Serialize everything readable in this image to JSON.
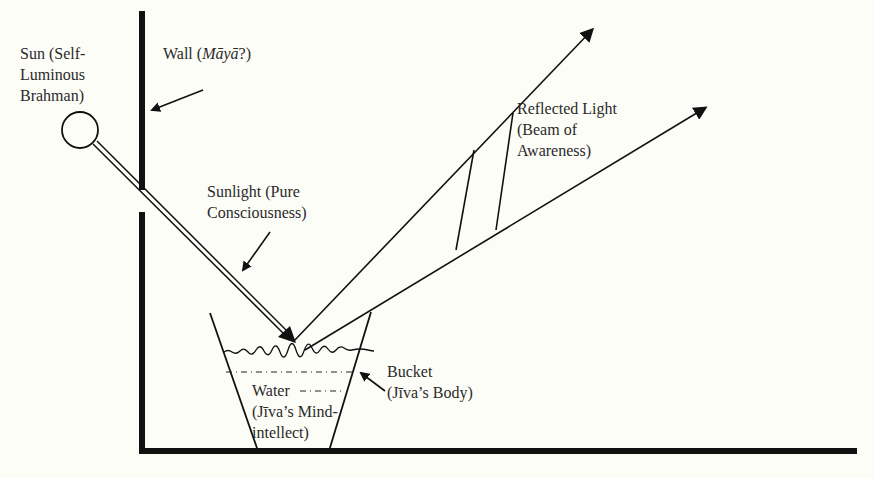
{
  "diagram": {
    "colors": {
      "background": "#fdfdf8",
      "ink": "#111111",
      "text": "#2a2a2a"
    },
    "labels": {
      "sun": {
        "line1": "Sun (Self-",
        "line2": "Luminous",
        "line3": "Brahman)"
      },
      "wall": {
        "prefix": "Wall (",
        "italic": "Māyā",
        "suffix": "?)"
      },
      "sunlight": {
        "line1": "Sunlight (Pure",
        "line2": "Consciousness)"
      },
      "reflected_light": {
        "line1": "Reflected Light",
        "line2": "(Beam of",
        "line3": "Awareness)"
      },
      "bucket": {
        "line1": "Bucket",
        "line2": "(Jīva’s Body)"
      },
      "water": {
        "line1": "Water",
        "line2": "(Jīva’s Mind-",
        "line3": "intellect)"
      }
    },
    "elements": [
      {
        "name": "sun-circle",
        "shape": "circle"
      },
      {
        "name": "wall-upper",
        "shape": "thick vertical line"
      },
      {
        "name": "wall-lower",
        "shape": "thick vertical line"
      },
      {
        "name": "floor",
        "shape": "thick horizontal line"
      },
      {
        "name": "sunlight-beam",
        "shape": "double line arrow"
      },
      {
        "name": "reflected-beam-upper",
        "shape": "arrow"
      },
      {
        "name": "reflected-beam-lower",
        "shape": "arrow"
      },
      {
        "name": "bucket",
        "shape": "trapezoid"
      },
      {
        "name": "water-surface",
        "shape": "wavy line"
      }
    ]
  }
}
